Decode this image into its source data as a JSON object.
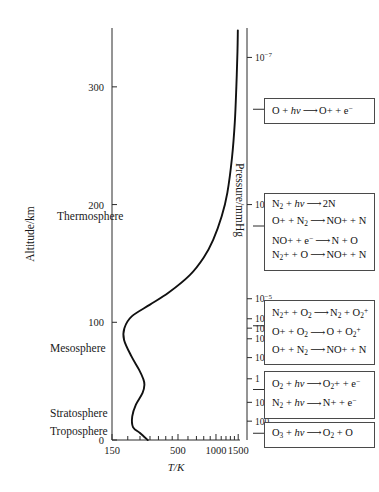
{
  "figure": {
    "background_color": "#ffffff",
    "curve_color": "#111111",
    "axis_color": "#2b2b2b"
  },
  "chart_data": {
    "type": "line",
    "title": "",
    "xlabel": "T/K",
    "ylabel": "Altitude/km",
    "secondary_ylabel": "Pressure/mmHg",
    "grid": false,
    "legend": "none",
    "xscale": "log",
    "xlim": [
      150,
      1550
    ],
    "ylim": [
      0,
      350
    ],
    "x_tick_labels": [
      "150",
      "500",
      "1000",
      "1500"
    ],
    "x_tick_values": [
      150,
      500,
      1000,
      1500
    ],
    "x_minor_ticks": [
      200,
      250,
      300,
      350,
      400,
      450,
      600,
      700,
      800,
      900,
      1100,
      1200,
      1300,
      1400
    ],
    "y_tick_labels": [
      "0",
      "100",
      "200",
      "300"
    ],
    "y_tick_values": [
      0,
      100,
      200,
      300
    ],
    "pressure_tick_labels": [
      "10-7",
      "10-6",
      "10-5",
      "10-4",
      "10-3",
      "10-2",
      "10-1",
      "1",
      "10",
      "100"
    ],
    "pressure_tick_altitudes_km": [
      325,
      200,
      120,
      103,
      95,
      86,
      70,
      52,
      32,
      16
    ],
    "series": [
      {
        "name": "Temperature profile",
        "points": [
          {
            "altitude_km": 0,
            "temperature_k": 288
          },
          {
            "altitude_km": 6,
            "temperature_k": 250
          },
          {
            "altitude_km": 11,
            "temperature_k": 220
          },
          {
            "altitude_km": 20,
            "temperature_k": 217
          },
          {
            "altitude_km": 30,
            "temperature_k": 232
          },
          {
            "altitude_km": 40,
            "temperature_k": 262
          },
          {
            "altitude_km": 47,
            "temperature_k": 271
          },
          {
            "altitude_km": 52,
            "temperature_k": 265
          },
          {
            "altitude_km": 60,
            "temperature_k": 245
          },
          {
            "altitude_km": 71,
            "temperature_k": 214
          },
          {
            "altitude_km": 85,
            "temperature_k": 187
          },
          {
            "altitude_km": 95,
            "temperature_k": 188
          },
          {
            "altitude_km": 105,
            "temperature_k": 215
          },
          {
            "altitude_km": 115,
            "temperature_k": 300
          },
          {
            "altitude_km": 125,
            "temperature_k": 420
          },
          {
            "altitude_km": 140,
            "temperature_k": 620
          },
          {
            "altitude_km": 155,
            "temperature_k": 800
          },
          {
            "altitude_km": 170,
            "temperature_k": 950
          },
          {
            "altitude_km": 190,
            "temperature_k": 1110
          },
          {
            "altitude_km": 210,
            "temperature_k": 1230
          },
          {
            "altitude_km": 240,
            "temperature_k": 1340
          },
          {
            "altitude_km": 270,
            "temperature_k": 1410
          },
          {
            "altitude_km": 300,
            "temperature_k": 1450
          },
          {
            "altitude_km": 330,
            "temperature_k": 1480
          },
          {
            "altitude_km": 348,
            "temperature_k": 1490
          }
        ]
      }
    ],
    "layer_annotations": [
      {
        "label": "Thermosphere",
        "altitude_km": 190
      },
      {
        "label": "Mesosphere",
        "altitude_km": 78
      },
      {
        "label": "Stratosphere",
        "altitude_km": 23
      },
      {
        "label": "Troposphere",
        "altitude_km": 8
      }
    ]
  },
  "reaction_boxes": [
    {
      "name": "oxygen-photoionization",
      "altitude_label": "thermosphere-upper",
      "reactions": [
        {
          "reactant": "O + hv",
          "product": "O+ + e-"
        }
      ]
    },
    {
      "name": "nitrogen-chemistry",
      "altitude_label": "thermosphere-mid",
      "reactions": [
        {
          "reactant": "N2 + hv",
          "product": "2N"
        },
        {
          "reactant": "O+ + N2",
          "product": "NO+ + N"
        },
        {
          "reactant": "NO+ + e-",
          "product": "N + O"
        },
        {
          "reactant": "N2+ + O",
          "product": "NO+ + N"
        }
      ]
    },
    {
      "name": "charge-transfer-reactions",
      "altitude_label": "lower-thermosphere",
      "reactions": [
        {
          "reactant": "N2+ + O2",
          "product": "N2 + O2+"
        },
        {
          "reactant": "O+ + O2",
          "product": "O + O2+"
        },
        {
          "reactant": "O+ + N2",
          "product": "NO+ + N"
        }
      ]
    },
    {
      "name": "molecular-photoionization",
      "altitude_label": "mesosphere",
      "reactions": [
        {
          "reactant": "O2 + hv",
          "product": "O2+ + e-"
        },
        {
          "reactant": "N2 + hv",
          "product": "N+ + e-"
        }
      ]
    },
    {
      "name": "ozone-photolysis",
      "altitude_label": "stratosphere",
      "reactions": [
        {
          "reactant": "O3 + hv",
          "product": "O2 + O"
        }
      ]
    }
  ]
}
